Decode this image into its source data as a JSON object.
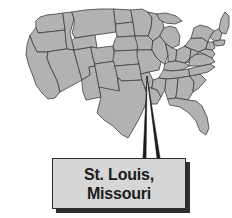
{
  "figure": {
    "type": "map-with-callout",
    "width": 232,
    "height": 218
  },
  "map": {
    "name": "united-states-map",
    "region": "Contiguous United States",
    "state_fill_color": "#b2b2b2",
    "state_border_color": "#3d3d3d",
    "background_color": "#ffffff",
    "shows_state_borders": true
  },
  "callout": {
    "label_line_1": "St. Louis,",
    "label_line_2": "Missouri",
    "box_fill_color": "#d6d6d6",
    "box_border_color": "#2b2b2b",
    "shadow_color": "#2e2e2e",
    "text_color": "#1c1c1c",
    "pointer": {
      "name": "callout-pointer-wedge",
      "color": "#1a1a1a",
      "target_location": "St. Louis, Missouri",
      "apex_x": 147,
      "apex_y": 76
    }
  }
}
